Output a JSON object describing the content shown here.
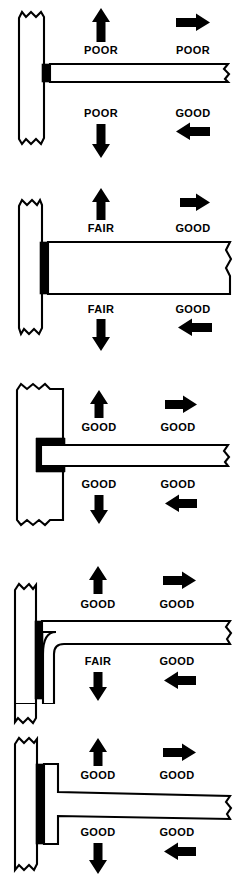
{
  "diagram": {
    "ratings_legend": [
      "POOR",
      "FAIR",
      "GOOD"
    ],
    "colors": {
      "ink": "#000000",
      "paper": "#ffffff"
    },
    "panels": [
      {
        "id": "panel-1",
        "joint_type": "thin-fillet-butt-weld",
        "ratings": {
          "up": "POOR",
          "right": "POOR",
          "down": "POOR",
          "left": "GOOD"
        }
      },
      {
        "id": "panel-2",
        "joint_type": "thick-fillet-weld",
        "ratings": {
          "up": "FAIR",
          "right": "GOOD",
          "down": "FAIR",
          "left": "GOOD"
        }
      },
      {
        "id": "panel-3",
        "joint_type": "slotted-groove-joint",
        "ratings": {
          "up": "GOOD",
          "right": "GOOD",
          "down": "GOOD",
          "left": "GOOD"
        }
      },
      {
        "id": "panel-4",
        "joint_type": "bent-angle-bracket",
        "ratings": {
          "up": "GOOD",
          "right": "GOOD",
          "down": "FAIR",
          "left": "GOOD"
        }
      },
      {
        "id": "panel-5",
        "joint_type": "flared-flange-joint",
        "ratings": {
          "up": "GOOD",
          "right": "GOOD",
          "down": "GOOD",
          "left": "GOOD"
        }
      }
    ],
    "arrows": {
      "up": "arrow-up-icon",
      "right": "arrow-right-icon",
      "down": "arrow-down-icon",
      "left": "arrow-left-icon"
    }
  }
}
